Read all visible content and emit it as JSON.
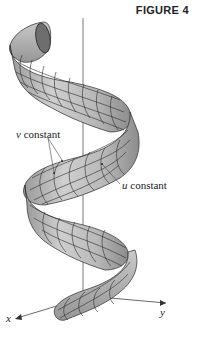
{
  "figure": {
    "caption": "FIGURE 4",
    "labels": {
      "v_constant": {
        "var": "v",
        "text": " constant"
      },
      "u_constant": {
        "var": "u",
        "text": " constant"
      }
    },
    "axes": {
      "x": "x",
      "y": "y",
      "z": ""
    },
    "colors": {
      "surface_fill": "#bdbdbd",
      "surface_shadow": "#8f8f8f",
      "grid_line": "#2a2a2a",
      "axis_line": "#555555",
      "background": "#ffffff"
    }
  }
}
